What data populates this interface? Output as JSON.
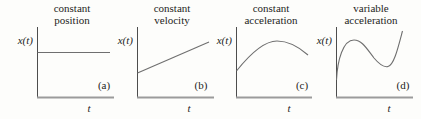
{
  "figure": {
    "description_colors": {
      "background": "#fdfdfb",
      "text": "#1d1d1b",
      "vertical_axis": "#4d4d4d",
      "baseline_axis": "#9b9b9b",
      "curve": "#6f6f6f"
    },
    "panels": [
      {
        "title_line1": "constant",
        "title_line2": "position",
        "ylabel": "x(t)",
        "xlabel": "t",
        "tag": "(a)",
        "curve_shape": "horizontal line (x constant over t)",
        "vaxis": "M37.5,27 L37.5,97.5",
        "haxis": "M37,97.5 L114,97.5",
        "curve": "M37.5,52.5 L110,52.5"
      },
      {
        "title_line1": "constant",
        "title_line2": "velocity",
        "ylabel": "x(t)",
        "xlabel": "t",
        "tag": "(b)",
        "curve_shape": "straight line with positive slope",
        "vaxis": "M137.5,27 L137.5,97.5",
        "haxis": "M137,97.5 L214,97.5",
        "curve": "M137.5,73 L209,42"
      },
      {
        "title_line1": "constant",
        "title_line2": "acceleration",
        "ylabel": "x(t)",
        "xlabel": "t",
        "tag": "(c)",
        "curve_shape": "parabolic arc rising to a peak then falling",
        "vaxis": "M236.5,27 L236.5,97.5",
        "haxis": "M236,97.5 L312,97.5",
        "curve": "M236.5,71 C250,54 264,41 277,41 C288,41 299,47 308,55"
      },
      {
        "title_line1": "variable",
        "title_line2": "acceleration",
        "ylabel": "x(t)",
        "xlabel": "t",
        "tag": "(d)",
        "curve_shape": "S-shaped cubic: steep rise, local max, dip to local min, rise again",
        "vaxis": "M336.5,27 L336.5,97.5",
        "haxis": "M336,97.5 L413,97.5",
        "curve": "M336.5,80 C337.5,60 343,40 354,40 C362,40 367,49 374,58 C379,64 384,67.5 388,66.5 C394,65 398,48 402.5,31"
      }
    ]
  }
}
